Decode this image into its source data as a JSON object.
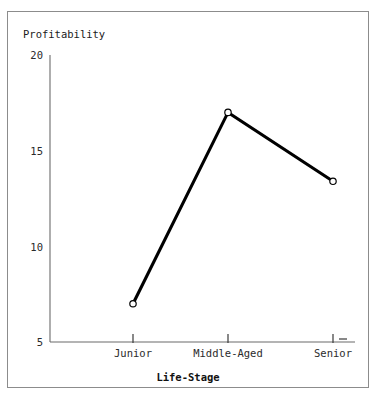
{
  "chart_data": {
    "type": "line",
    "title": "",
    "subtitle": "",
    "xlabel": "Life-Stage",
    "ylabel": "Profitability",
    "categories": [
      "Junior",
      "Middle-Aged",
      "Senior"
    ],
    "values": [
      7,
      17,
      13.4
    ],
    "series": [
      {
        "name": "Profitability",
        "values": [
          7,
          17,
          13.4
        ]
      }
    ],
    "ylim": [
      5,
      20
    ],
    "yticks": [
      5,
      10,
      15,
      20
    ],
    "ytick_labels": [
      "5",
      "10",
      "15",
      "20"
    ],
    "xtick_labels": [
      "Junior",
      "Middle-Aged",
      "Senior"
    ],
    "grid": false,
    "legend": false,
    "legend_position": "none",
    "marker": "open-circle",
    "line_color": "#000000",
    "marker_fill": "#ffffff",
    "axis_color": "#6b6b6b",
    "frame_color": "#8c8c8c",
    "background": "#ffffff"
  },
  "axes": {
    "y_title": "Profitability",
    "x_title": "Life-Stage",
    "y_ticks": [
      {
        "label": "20",
        "value": 20
      },
      {
        "label": "15",
        "value": 15
      },
      {
        "label": "10",
        "value": 10
      },
      {
        "label": "5",
        "value": 5
      }
    ],
    "x_ticks": [
      {
        "label": "Junior"
      },
      {
        "label": "Middle-Aged"
      },
      {
        "label": "Senior"
      }
    ]
  },
  "artifacts": {
    "bleed_a": "",
    "bleed_b": ""
  }
}
